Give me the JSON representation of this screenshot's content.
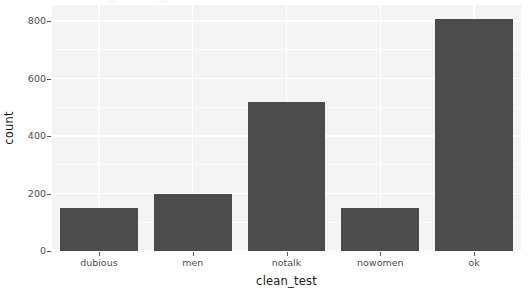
{
  "chart_data": {
    "type": "bar",
    "title": "",
    "subtitle": "",
    "xlabel": "clean_test",
    "ylabel": "count",
    "categories": [
      "dubious",
      "men",
      "notalk",
      "nowomen",
      "ok"
    ],
    "values": [
      150,
      200,
      517,
      150,
      806
    ],
    "series": [
      {
        "name": "count",
        "values": [
          150,
          200,
          517,
          150,
          806
        ]
      }
    ],
    "ylim": [
      0,
      830
    ],
    "y_ticks": [
      0,
      200,
      400,
      600,
      800
    ],
    "y_tick_labels": [
      "0",
      "200",
      "400",
      "600",
      "800"
    ],
    "x_tick_labels": [
      "dubious",
      "men",
      "notalk",
      "nowomen",
      "ok"
    ],
    "grid": true,
    "grid_color": "#ffffff",
    "legend": "none",
    "bar_color": "#4b4b4b",
    "panel_background": "#f4f4f4",
    "plot_background": "#ffffff",
    "axis_text_color": "#4d4d4d",
    "axis_title_color": "#1a1a1a"
  }
}
